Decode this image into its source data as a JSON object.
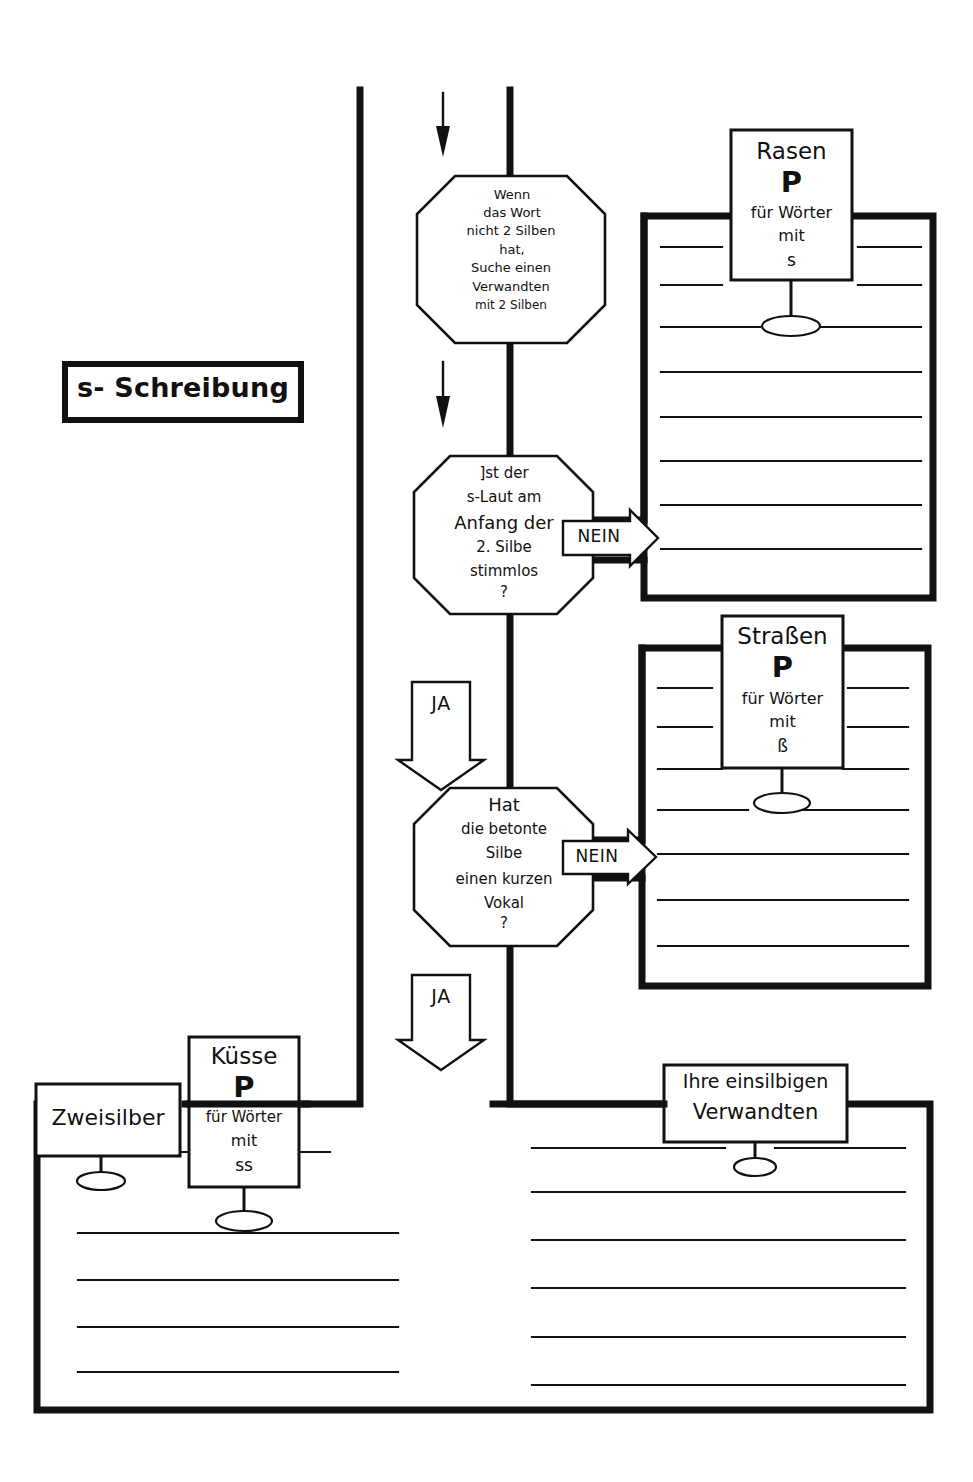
{
  "title": {
    "text": "s- Schreibung"
  },
  "decisions": [
    {
      "id": "two-syllable-check",
      "lines": [
        "Wenn",
        "das Wort",
        "nicht 2 Silben",
        "hat,",
        "Suche einen",
        "Verwandten",
        "mit 2 Silben"
      ]
    },
    {
      "id": "voiceless-check",
      "lines": [
        "]st der",
        "s-Laut am",
        "Anfang der",
        "2. Silbe",
        "stimmlos",
        "?"
      ]
    },
    {
      "id": "short-vowel-check",
      "lines": [
        "Hat",
        "die betonte",
        "Silbe",
        "einen kurzen",
        "Vokal",
        "?"
      ]
    }
  ],
  "flags": {
    "no_1": "NEIN",
    "no_2": "NEIN",
    "yes_1": "JA",
    "yes_2": "JA"
  },
  "cards": [
    {
      "id": "rasen-card",
      "head": "Rasen",
      "symbol": "P",
      "sub1": "für Wörter",
      "sub2": "mit",
      "value": "s"
    },
    {
      "id": "strassen-card",
      "head": "Straßen",
      "symbol": "P",
      "sub1": "für Wörter",
      "sub2": "mit",
      "value": "ß"
    },
    {
      "id": "kuesse-card",
      "head": "Küsse",
      "symbol": "P",
      "sub1": "für Wörter",
      "sub2": "mit",
      "value": "ss"
    }
  ],
  "labels": {
    "zweisilber": "Zweisilber",
    "einsilbige_line1": "Ihre einsilbigen",
    "einsilbige_line2": "Verwandten"
  },
  "colors": {
    "ink": "#111111",
    "paper": "#ffffff"
  }
}
